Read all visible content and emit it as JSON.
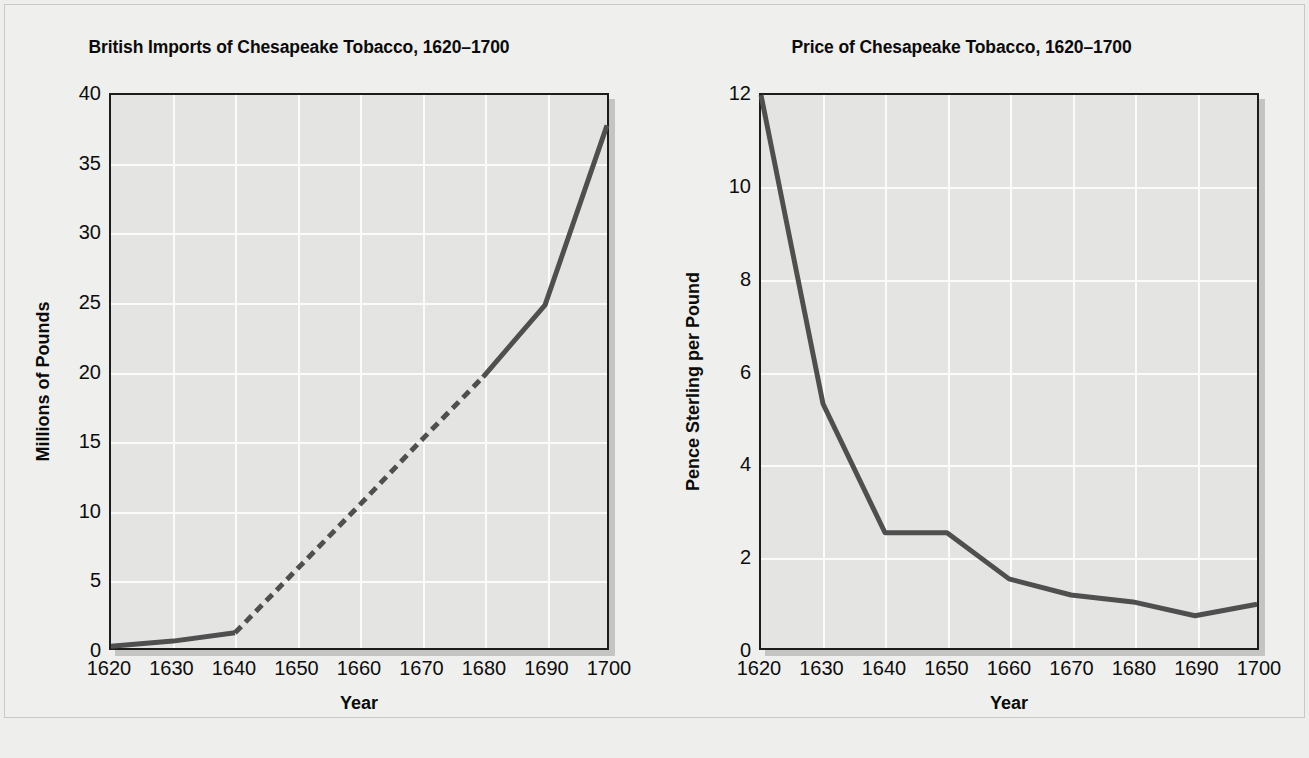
{
  "page": {
    "background_color": "#eeeeec",
    "plot_background_color": "#e4e4e2",
    "gridline_color": "#fbfbfa",
    "line_color": "#4f4f4f",
    "axis_color": "#1c1c1c"
  },
  "chart_data": [
    {
      "type": "line",
      "title": "British Imports of Chesapeake Tobacco, 1620–1700",
      "xlabel": "Year",
      "ylabel": "Millions of Pounds",
      "xlim": [
        1620,
        1700
      ],
      "ylim": [
        0,
        40
      ],
      "xticks": [
        "1620",
        "1630",
        "1640",
        "1650",
        "1660",
        "1670",
        "1680",
        "1690",
        "1700"
      ],
      "yticks": [
        "0",
        "5",
        "10",
        "15",
        "20",
        "25",
        "30",
        "35",
        "40"
      ],
      "grid": true,
      "legend": "none",
      "x": [
        1620,
        1630,
        1640,
        1650,
        1660,
        1670,
        1680,
        1690,
        1700
      ],
      "values": [
        0.12,
        0.5,
        1.1,
        5.7,
        10.3,
        15.0,
        19.6,
        24.8,
        37.8
      ],
      "series": [
        {
          "name": "Imports (millions of pounds)",
          "values": [
            0.12,
            0.5,
            1.1,
            5.7,
            10.3,
            15.0,
            19.6,
            24.8,
            37.8
          ],
          "segments": [
            {
              "style": "solid",
              "x": [
                1620,
                1630,
                1640
              ],
              "values": [
                0.12,
                0.5,
                1.1
              ]
            },
            {
              "style": "dashed",
              "x": [
                1640,
                1650,
                1660,
                1670,
                1680
              ],
              "values": [
                1.1,
                5.7,
                10.3,
                15.0,
                19.6
              ]
            },
            {
              "style": "solid",
              "x": [
                1680,
                1690,
                1700
              ],
              "values": [
                19.6,
                24.8,
                37.8
              ]
            }
          ]
        }
      ],
      "annotations": [
        "Dashed segment between 1640 and 1680 indicates estimated data"
      ]
    },
    {
      "type": "line",
      "title": "Price of Chesapeake Tobacco, 1620–1700",
      "xlabel": "Year",
      "ylabel": "Pence Sterling per Pound",
      "xlim": [
        1620,
        1700
      ],
      "ylim": [
        0,
        12
      ],
      "xticks": [
        "1620",
        "1630",
        "1640",
        "1650",
        "1660",
        "1670",
        "1680",
        "1690",
        "1700"
      ],
      "yticks": [
        "0",
        "2",
        "4",
        "6",
        "8",
        "10",
        "12"
      ],
      "grid": true,
      "legend": "none",
      "x": [
        1620,
        1630,
        1640,
        1650,
        1660,
        1670,
        1680,
        1690,
        1700
      ],
      "values": [
        12.0,
        5.3,
        2.5,
        2.5,
        1.5,
        1.15,
        1.0,
        0.7,
        0.95
      ],
      "series": [
        {
          "name": "Price (pence sterling per pound)",
          "values": [
            12.0,
            5.3,
            2.5,
            2.5,
            1.5,
            1.15,
            1.0,
            0.7,
            0.95
          ],
          "segments": [
            {
              "style": "solid",
              "x": [
                1620,
                1630,
                1640,
                1650,
                1660,
                1670,
                1680,
                1690,
                1700
              ],
              "values": [
                12.0,
                5.3,
                2.5,
                2.5,
                1.5,
                1.15,
                1.0,
                0.7,
                0.95
              ]
            }
          ]
        }
      ],
      "annotations": []
    }
  ]
}
